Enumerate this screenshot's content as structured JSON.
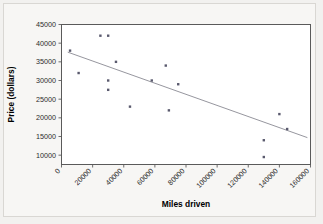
{
  "chart_data": {
    "type": "scatter",
    "title": "",
    "xlabel": "Miles driven",
    "ylabel": "Price (dollars)",
    "xlim": [
      0,
      160000
    ],
    "ylim": [
      7500,
      45000
    ],
    "xticks": [
      0,
      20000,
      40000,
      60000,
      80000,
      100000,
      120000,
      140000,
      160000
    ],
    "xtick_labels": [
      "0",
      "20000",
      "40000",
      "60000",
      "80000",
      "100000",
      "120000",
      "140000",
      "160000"
    ],
    "yticks": [
      10000,
      15000,
      20000,
      25000,
      30000,
      35000,
      40000,
      45000
    ],
    "ytick_labels": [
      "10000",
      "15000",
      "20000",
      "25000",
      "30000",
      "35000",
      "40000",
      "45000"
    ],
    "grid": false,
    "legend": null,
    "marker_color": "#5a5a6e",
    "line_color": "#8a8a93",
    "plot_bg": "#ffffff",
    "figure_bg": "#f2f1ef",
    "points": [
      {
        "x": 5500,
        "y": 38000
      },
      {
        "x": 11000,
        "y": 32000
      },
      {
        "x": 25000,
        "y": 42000
      },
      {
        "x": 30000,
        "y": 42000
      },
      {
        "x": 35000,
        "y": 35000
      },
      {
        "x": 30000,
        "y": 30000
      },
      {
        "x": 30000,
        "y": 27500
      },
      {
        "x": 44000,
        "y": 23000
      },
      {
        "x": 58000,
        "y": 30000
      },
      {
        "x": 67000,
        "y": 34000
      },
      {
        "x": 69000,
        "y": 22000
      },
      {
        "x": 75000,
        "y": 29000
      },
      {
        "x": 130000,
        "y": 14000
      },
      {
        "x": 130000,
        "y": 9500
      },
      {
        "x": 140000,
        "y": 21000
      },
      {
        "x": 145000,
        "y": 17000
      }
    ],
    "trend_line": {
      "x_start": 4000,
      "y_start": 37600,
      "x_end": 158000,
      "y_end": 14700
    }
  }
}
